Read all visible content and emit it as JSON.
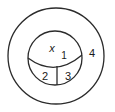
{
  "figure": {
    "type": "region-diagram",
    "background_color": "#ffffff",
    "stroke_color": "#2b2b2b",
    "outer_circle": {
      "name": "outer-circle",
      "center_x": 56,
      "center_y": 56,
      "radius": 48
    },
    "inner_circle": {
      "name": "inner-circle",
      "center_x": 55,
      "center_y": 58,
      "radius": 27
    },
    "dividing_arc": {
      "name": "dividing-arc",
      "start_x": 28,
      "start_y": 58,
      "end_x": 82,
      "end_y": 55,
      "sweep": "concave-up"
    },
    "vertical_divider": {
      "name": "vertical-divider",
      "x": 57,
      "y_top": 66,
      "y_bottom": 85
    },
    "labels": [
      {
        "id": "x",
        "text": "x",
        "x": 52,
        "y": 49,
        "style": "italic"
      },
      {
        "id": "r1",
        "text": "1",
        "x": 64,
        "y": 55,
        "style": "small"
      },
      {
        "id": "r2",
        "text": "2",
        "x": 45,
        "y": 77,
        "style": "normal"
      },
      {
        "id": "r3",
        "text": "3",
        "x": 68,
        "y": 77,
        "style": "normal"
      },
      {
        "id": "r4",
        "text": "4",
        "x": 92,
        "y": 54,
        "style": "normal"
      }
    ]
  }
}
